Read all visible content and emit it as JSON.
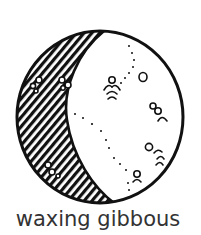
{
  "figure": {
    "caption": "waxing gibbous",
    "phase": "waxing gibbous",
    "illustration": "moon-phase-icon",
    "lit_side": "right",
    "shaded_side": "left",
    "shading_style": "diagonal-hatch",
    "colors": {
      "ink": "#111111",
      "caption": "#333333",
      "background": "#ffffff"
    }
  }
}
